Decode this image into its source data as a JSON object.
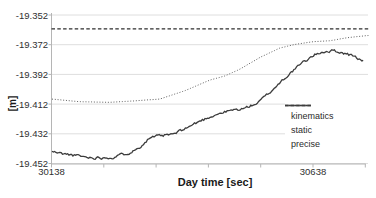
{
  "figure": {
    "background": "#ffffff",
    "grid_color": "#dedede",
    "axis_color": "#b5b5b5",
    "text_color": "#303030",
    "kinematics_color": "#3c3c3c",
    "static_color": "#5f5f5f",
    "precise_color": "#2e2e2e"
  },
  "chart_data": {
    "type": "line",
    "title": "",
    "xlabel": "Day time [sec]",
    "ylabel": "[m]",
    "xlim": [
      30138,
      30748
    ],
    "ylim": [
      -19.452,
      -19.352
    ],
    "grid": "horizontal",
    "legend_position": "inside-right",
    "x_major_ticks": [
      30138,
      30238,
      30338,
      30438,
      30538,
      30638,
      30738
    ],
    "x_tick_labels": [
      {
        "value": 30138,
        "label": "30138"
      },
      {
        "value": 30638,
        "label": "30638"
      }
    ],
    "y_ticks": [
      {
        "value": -19.352,
        "label": "-19.352"
      },
      {
        "value": -19.372,
        "label": "-19.372"
      },
      {
        "value": -19.392,
        "label": "-19.392"
      },
      {
        "value": -19.412,
        "label": "-19.412"
      },
      {
        "value": -19.432,
        "label": "-19.432"
      },
      {
        "value": -19.452,
        "label": "-19.452"
      }
    ],
    "series": [
      {
        "name": "kinematics",
        "style": "solid",
        "noise_amplitude": 0.0009,
        "points": [
          [
            30139,
            -19.444
          ],
          [
            30160,
            -19.4455
          ],
          [
            30183,
            -19.4465
          ],
          [
            30205,
            -19.4478
          ],
          [
            30221,
            -19.448
          ],
          [
            30254,
            -19.4478
          ],
          [
            30279,
            -19.4455
          ],
          [
            30303,
            -19.442
          ],
          [
            30326,
            -19.4345
          ],
          [
            30349,
            -19.4335
          ],
          [
            30374,
            -19.432
          ],
          [
            30403,
            -19.4268
          ],
          [
            30426,
            -19.4228
          ],
          [
            30451,
            -19.419
          ],
          [
            30479,
            -19.4165
          ],
          [
            30508,
            -19.4148
          ],
          [
            30533,
            -19.411
          ],
          [
            30556,
            -19.404
          ],
          [
            30579,
            -19.396
          ],
          [
            30598,
            -19.39
          ],
          [
            30617,
            -19.3845
          ],
          [
            30638,
            -19.3795
          ],
          [
            30655,
            -19.3768
          ],
          [
            30676,
            -19.376
          ],
          [
            30699,
            -19.3778
          ],
          [
            30718,
            -19.38
          ],
          [
            30734,
            -19.3832
          ]
        ]
      },
      {
        "name": "static",
        "style": "dotted",
        "noise_amplitude": 0,
        "points": [
          [
            30139,
            -19.4086
          ],
          [
            30192,
            -19.4104
          ],
          [
            30250,
            -19.4108
          ],
          [
            30298,
            -19.4098
          ],
          [
            30345,
            -19.4086
          ],
          [
            30393,
            -19.403
          ],
          [
            30441,
            -19.3958
          ],
          [
            30470,
            -19.393
          ],
          [
            30498,
            -19.3885
          ],
          [
            30537,
            -19.3805
          ],
          [
            30575,
            -19.3742
          ],
          [
            30604,
            -19.3718
          ],
          [
            30638,
            -19.37
          ],
          [
            30671,
            -19.3693
          ],
          [
            30705,
            -19.3672
          ],
          [
            30738,
            -19.366
          ],
          [
            30745,
            -19.3658
          ]
        ]
      },
      {
        "name": "precise",
        "style": "dashed",
        "noise_amplitude": 0,
        "points": [
          [
            30138,
            -19.3613
          ],
          [
            30745,
            -19.3613
          ]
        ]
      }
    ]
  },
  "legend": {
    "items": [
      {
        "label": "kinematics",
        "style": "solid"
      },
      {
        "label": "static",
        "style": "dotted"
      },
      {
        "label": "precise",
        "style": "dashed"
      }
    ]
  }
}
